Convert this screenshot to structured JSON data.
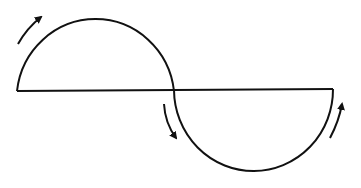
{
  "diagram": {
    "stroke_color": "#111111",
    "background": "#ffffff",
    "baseline": {
      "x1": 17,
      "y1": 91,
      "x2": 333,
      "y2": 89
    },
    "upper_semicircle": {
      "cx": 96,
      "cy": 91,
      "r": 79
    },
    "lower_semicircle": {
      "cx": 253,
      "cy": 90,
      "r": 79
    },
    "arrows": [
      {
        "name": "arrow-upper-left",
        "direction": "clockwise-up"
      },
      {
        "name": "arrow-lower-left",
        "direction": "down"
      },
      {
        "name": "arrow-lower-right",
        "direction": "up"
      }
    ]
  }
}
